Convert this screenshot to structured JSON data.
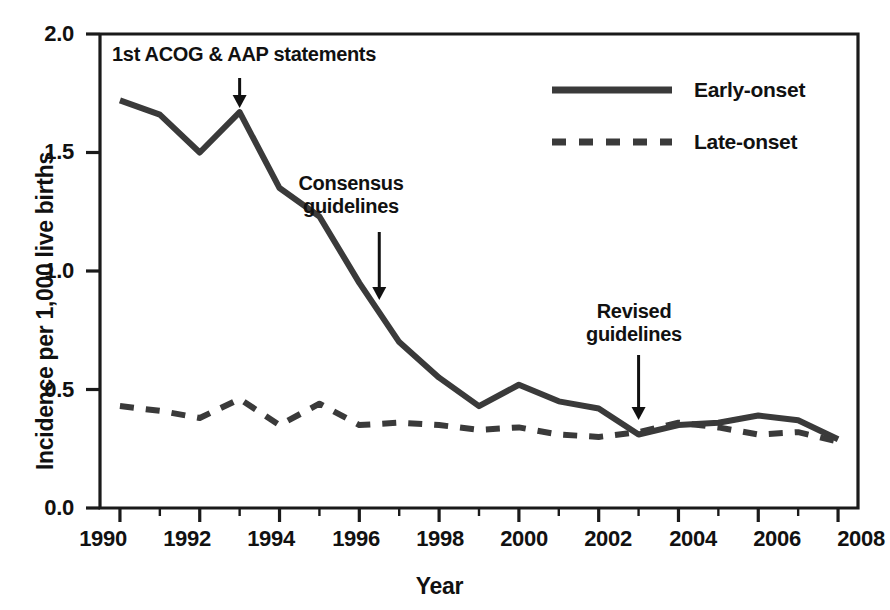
{
  "chart_data": {
    "type": "line",
    "title": "",
    "xlabel": "Year",
    "ylabel": "Incidence per 1,000 live births",
    "xlim": [
      1989.5,
      2008.5
    ],
    "ylim": [
      0.0,
      2.0
    ],
    "grid": false,
    "legend_position": "top-right",
    "x": [
      1990,
      1991,
      1992,
      1993,
      1994,
      1995,
      1996,
      1997,
      1998,
      1999,
      2000,
      2001,
      2002,
      2003,
      2004,
      2005,
      2006,
      2007,
      2008
    ],
    "xticks_major": [
      "1990",
      "1992",
      "1994",
      "1996",
      "1998",
      "2000",
      "2002",
      "2004",
      "2006",
      "2008"
    ],
    "yticks": [
      "0.0",
      "0.5",
      "1.0",
      "1.5",
      "2.0"
    ],
    "series": [
      {
        "name": "Early-onset",
        "style": "solid",
        "color": "#3a3a3a",
        "values": [
          1.72,
          1.66,
          1.5,
          1.67,
          1.35,
          1.23,
          0.95,
          0.7,
          0.55,
          0.43,
          0.52,
          0.45,
          0.42,
          0.31,
          0.35,
          0.36,
          0.39,
          0.37,
          0.29
        ]
      },
      {
        "name": "Late-onset",
        "style": "dashed",
        "color": "#3a3a3a",
        "values": [
          0.43,
          0.41,
          0.38,
          0.46,
          0.35,
          0.44,
          0.35,
          0.36,
          0.35,
          0.33,
          0.34,
          0.31,
          0.3,
          0.32,
          0.36,
          0.34,
          0.31,
          0.32,
          0.28
        ]
      }
    ],
    "annotations": [
      {
        "text": "1st ACOG & AAP statements",
        "line1": "1st ACOG & AAP statements",
        "line2": "",
        "x": 1993,
        "y": 1.67
      },
      {
        "text": "Consensus guidelines",
        "line1": "Consensus",
        "line2": "guidelines",
        "x": 1996.5,
        "y": 0.82
      },
      {
        "text": "Revised guidelines",
        "line1": "Revised",
        "line2": "guidelines",
        "x": 2003,
        "y": 0.4
      }
    ]
  },
  "legend": {
    "items": [
      {
        "label": "Early-onset",
        "style": "solid"
      },
      {
        "label": "Late-onset",
        "style": "dashed"
      }
    ]
  },
  "axes": {
    "y_title": "Incidence per 1,000 live births",
    "x_title": "Year",
    "y_ticks": [
      "2.0",
      "1.5",
      "1.0",
      "0.5",
      "0.0"
    ],
    "x_ticks": [
      "1990",
      "1992",
      "1994",
      "1996",
      "1998",
      "2000",
      "2002",
      "2004",
      "2006",
      "2008"
    ]
  },
  "caption": {
    "text": " "
  }
}
